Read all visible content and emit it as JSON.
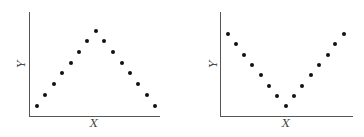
{
  "chart_data": [
    {
      "type": "scatter",
      "title": "",
      "xlabel": "X",
      "ylabel": "Y",
      "shape": "inverted V (peak in middle)",
      "grid": false,
      "legend": null,
      "x": [
        1,
        2,
        3,
        4,
        5,
        6,
        7,
        8,
        9,
        10,
        11,
        12,
        13,
        14,
        15
      ],
      "y": [
        1,
        2,
        3,
        4,
        5,
        6,
        7,
        8,
        7,
        6,
        5,
        4,
        3,
        2,
        1
      ]
    },
    {
      "type": "scatter",
      "title": "",
      "xlabel": "X",
      "ylabel": "Y",
      "shape": "V (minimum in middle)",
      "grid": false,
      "legend": null,
      "x": [
        1,
        2,
        3,
        4,
        5,
        6,
        7,
        8,
        9,
        10,
        11,
        12,
        13,
        14,
        15
      ],
      "y": [
        8,
        7,
        6,
        5,
        4,
        3,
        2,
        1,
        2,
        3,
        4,
        5,
        6,
        7,
        8
      ]
    }
  ],
  "panels": [
    {
      "xlabel": "X",
      "ylabel": "Y",
      "axis": {
        "left": 29,
        "top": 12,
        "bottom": 116,
        "right": 160
      },
      "xlabel_pos": [
        94,
        123
      ],
      "ylabel_pos": [
        21,
        64
      ],
      "points_px": [
        [
          37,
          106
        ],
        [
          45,
          95
        ],
        [
          54,
          84
        ],
        [
          62,
          73
        ],
        [
          71,
          63
        ],
        [
          79,
          52
        ],
        [
          87,
          41
        ],
        [
          96,
          31
        ],
        [
          104,
          41
        ],
        [
          113,
          52
        ],
        [
          122,
          63
        ],
        [
          130,
          73
        ],
        [
          138,
          84
        ],
        [
          147,
          95
        ],
        [
          155,
          106
        ]
      ]
    },
    {
      "xlabel": "X",
      "ylabel": "Y",
      "axis": {
        "left": 220,
        "top": 12,
        "bottom": 116,
        "right": 353
      },
      "xlabel_pos": [
        286,
        123
      ],
      "ylabel_pos": [
        213,
        64
      ],
      "points_px": [
        [
          228,
          34
        ],
        [
          236,
          44
        ],
        [
          244,
          55
        ],
        [
          252,
          65
        ],
        [
          261,
          75
        ],
        [
          269,
          86
        ],
        [
          277,
          96
        ],
        [
          286,
          106
        ],
        [
          294,
          96
        ],
        [
          302,
          86
        ],
        [
          311,
          75
        ],
        [
          319,
          65
        ],
        [
          328,
          55
        ],
        [
          335,
          44
        ],
        [
          344,
          34
        ]
      ]
    }
  ]
}
